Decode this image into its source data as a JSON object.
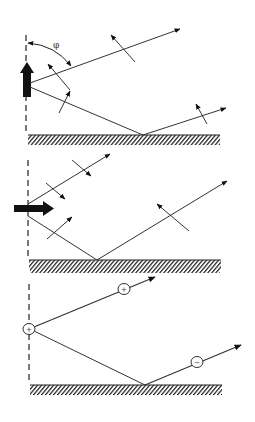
{
  "diagram": {
    "type": "physics-diagram",
    "colors": {
      "line": "#333333",
      "ink": "#111111",
      "background": "#ffffff"
    },
    "panels": [
      {
        "id": "vertical-polarization",
        "source_arrow": "vertical (up)",
        "angle_label": "φ",
        "rays": [
          "direct ray to upper right",
          "ray to ground, reflected to right"
        ]
      },
      {
        "id": "horizontal-polarization",
        "source_arrow": "horizontal (right)",
        "rays": [
          "direct ray to upper right",
          "ray to ground, reflected to upper right"
        ]
      },
      {
        "id": "charge-representation",
        "source_charge": "+",
        "direct_ray_charge": "+",
        "reflected_ray_charge": "−",
        "rays": [
          "direct ray to upper right",
          "ray to ground, reflected to right"
        ]
      }
    ],
    "labels": {
      "phi": "φ",
      "plus": "+",
      "minus": "−"
    }
  }
}
